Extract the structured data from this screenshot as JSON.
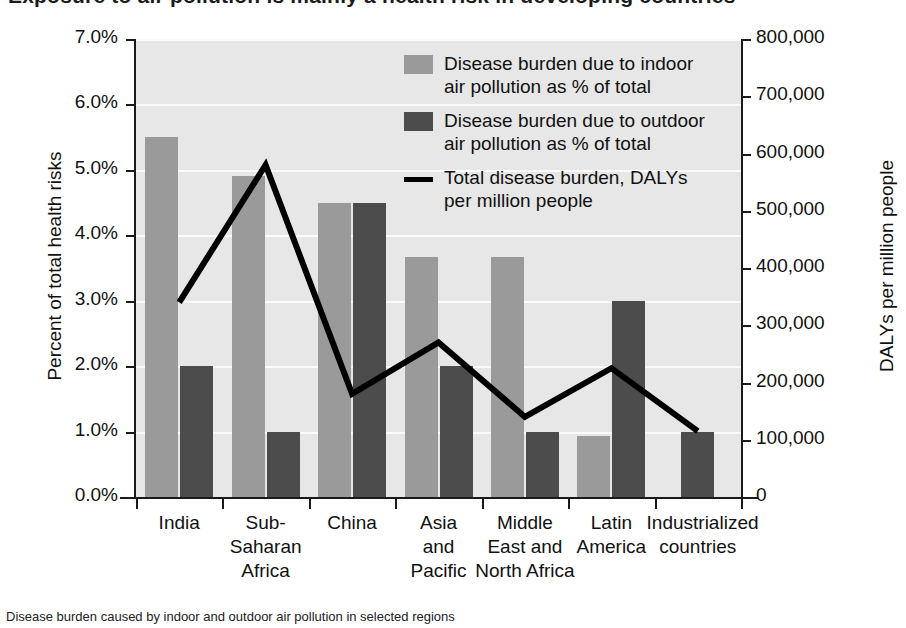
{
  "title_crop": "Exposure to air pollution is mainly a health risk in developing countries",
  "caption_crop": "Disease burden caused by indoor and outdoor air pollution in selected regions",
  "chart_data": {
    "type": "bar",
    "title": "",
    "categories": [
      "India",
      "Sub-\nSaharan\nAfrica",
      "China",
      "Asia\nand\nPacific",
      "Middle\nEast and\nNorth Africa",
      "Latin\nAmerica",
      "Industrialized\ncountries"
    ],
    "series": [
      {
        "name": "Disease burden due to indoor air pollution as % of total",
        "type": "bar",
        "axis": "left",
        "color": "#9a9a9a",
        "values": [
          5.5,
          4.9,
          4.5,
          3.67,
          3.67,
          0.93,
          0
        ]
      },
      {
        "name": "Disease burden due to outdoor air pollution as % of total",
        "type": "bar",
        "axis": "left",
        "color": "#4c4c4c",
        "values": [
          2.0,
          1.0,
          4.5,
          2.0,
          1.0,
          3.0,
          1.0
        ]
      },
      {
        "name": "Total disease burden, DALYs per million people",
        "type": "line",
        "axis": "right",
        "color": "#000000",
        "values": [
          340000,
          580000,
          180000,
          270000,
          140000,
          225000,
          115000
        ]
      }
    ],
    "ylabel": "Percent of total health risks",
    "ylim": [
      0,
      7
    ],
    "yticks": [
      "0.0%",
      "1.0%",
      "2.0%",
      "3.0%",
      "4.0%",
      "5.0%",
      "6.0%",
      "7.0%"
    ],
    "y2label": "DALYs per million people",
    "y2lim": [
      0,
      800000
    ],
    "y2ticks": [
      "0",
      "100,000",
      "200,000",
      "300,000",
      "400,000",
      "500,000",
      "600,000",
      "700,000",
      "800,000"
    ],
    "xlabel": "",
    "grid": true,
    "legend_position": "upper-center",
    "legend": [
      "Disease burden due to indoor\nair pollution as % of total",
      "Disease burden due to outdoor\nair pollution as % of total",
      "Total disease burden, DALYs\nper million people"
    ]
  }
}
